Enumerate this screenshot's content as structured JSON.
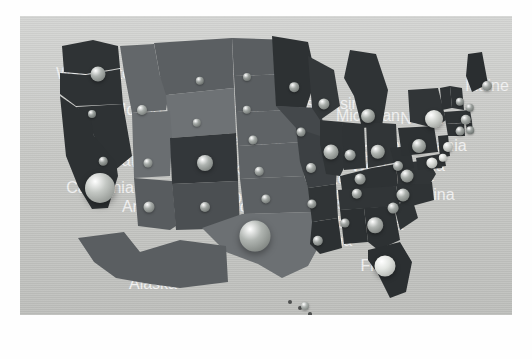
{
  "figure": {
    "type": "map",
    "title": "",
    "canvas_bg": "#c9cac7",
    "state_border_color": "#cfd0cd",
    "label_color": "#f2f2f2"
  },
  "chart_data": {
    "type": "map",
    "title": "",
    "xlabel": "",
    "ylabel": "",
    "projection": "albers-usa",
    "marker_style": "3d-sphere-bubble",
    "legend": "none",
    "grid": false,
    "choropleth_shades": [
      "#2b2f31",
      "#3a3e40",
      "#4e5254",
      "#5d6163",
      "#6a6e70",
      "#7c8082"
    ],
    "bubble_shades": [
      "#6f7473",
      "#8a8f8d",
      "#9ea3a1",
      "#b4b8b5",
      "#d7dad6",
      "#ececea"
    ],
    "states": [
      {
        "name": "Washington",
        "x": 78,
        "y": 58,
        "bubble": 7.5,
        "fill": "#2f3335",
        "shade": "#aeb3b0"
      },
      {
        "name": "Oregon",
        "x": 72,
        "y": 98,
        "bubble": 4.0,
        "fill": "#2e3234",
        "shade": "#9aa09d"
      },
      {
        "name": "Idaho",
        "x": 122,
        "y": 94,
        "bubble": 5.0,
        "fill": "#63676a",
        "shade": "#a8adaa"
      },
      {
        "name": "Montana",
        "x": 180,
        "y": 65,
        "bubble": 4.2,
        "fill": "#5b5f62",
        "shade": "#999e9b"
      },
      {
        "name": "Wyoming",
        "x": 177,
        "y": 107,
        "bubble": 4.2,
        "fill": "#6e7275",
        "shade": "#9fa4a1"
      },
      {
        "name": "North Dakota",
        "x": 227,
        "y": 61,
        "bubble": 4.0,
        "fill": "#5a5e61",
        "shade": "#9a9f9c"
      },
      {
        "name": "South Dakota",
        "x": 227,
        "y": 94,
        "bubble": 4.2,
        "fill": "#5a5e61",
        "shade": "#a0a5a2"
      },
      {
        "name": "Nebraska",
        "x": 233,
        "y": 124,
        "bubble": 4.5,
        "fill": "#5f6366",
        "shade": "#a4a9a6"
      },
      {
        "name": "Nevada",
        "x": 83,
        "y": 145,
        "bubble": 4.3,
        "fill": "#2e3234",
        "shade": "#9ba09d"
      },
      {
        "name": "Utah",
        "x": 128,
        "y": 147,
        "bubble": 4.5,
        "fill": "#6a6e71",
        "shade": "#a5aaa7"
      },
      {
        "name": "Colorado",
        "x": 185,
        "y": 147,
        "bubble": 8.0,
        "fill": "#33373a",
        "shade": "#adb2af"
      },
      {
        "name": "Kansas",
        "x": 239,
        "y": 155,
        "bubble": 4.3,
        "fill": "#5f6366",
        "shade": "#a2a7a4"
      },
      {
        "name": "California",
        "x": 80,
        "y": 172,
        "bubble": 15.0,
        "fill": "#2d3133",
        "shade": "#c3c7c3"
      },
      {
        "name": "Arizona",
        "x": 129,
        "y": 191,
        "bubble": 5.5,
        "fill": "#585c5f",
        "shade": "#a6aba8"
      },
      {
        "name": "New Mexico",
        "x": 185,
        "y": 191,
        "bubble": 5.0,
        "fill": "#4b4f52",
        "shade": "#a0a5a2"
      },
      {
        "name": "Oklahoma",
        "x": 246,
        "y": 183,
        "bubble": 4.6,
        "fill": "#5c6063",
        "shade": "#a1a6a3"
      },
      {
        "name": "Texas",
        "x": 235,
        "y": 220,
        "bubble": 15.5,
        "fill": "#6c7073",
        "shade": "#b0b5b1"
      },
      {
        "name": "Minnesota",
        "x": 274,
        "y": 71,
        "bubble": 4.8,
        "fill": "#2d3133",
        "shade": "#a1a6a3"
      },
      {
        "name": "Iowa",
        "x": 281,
        "y": 116,
        "bubble": 4.5,
        "fill": "#44484b",
        "shade": "#a0a5a2"
      },
      {
        "name": "Missouri",
        "x": 291,
        "y": 152,
        "bubble": 5.0,
        "fill": "#3c4043",
        "shade": "#a3a8a5"
      },
      {
        "name": "Arkansas",
        "x": 292,
        "y": 188,
        "bubble": 4.6,
        "fill": "#303436",
        "shade": "#9ea3a0"
      },
      {
        "name": "Louisiana",
        "x": 298,
        "y": 225,
        "bubble": 5.2,
        "fill": "#2c3032",
        "shade": "#a4a9a6"
      },
      {
        "name": "Wisconsin",
        "x": 304,
        "y": 88,
        "bubble": 5.6,
        "fill": "#34383a",
        "shade": "#a8ada9"
      },
      {
        "name": "Illinois",
        "x": 311,
        "y": 136,
        "bubble": 7.5,
        "fill": "#303436",
        "shade": "#aeb3af"
      },
      {
        "name": "Indiana",
        "x": 330,
        "y": 139,
        "bubble": 5.4,
        "fill": "#2f3335",
        "shade": "#a6aba8"
      },
      {
        "name": "Michigan",
        "x": 348,
        "y": 100,
        "bubble": 7.0,
        "fill": "#2f3335",
        "shade": "#abb0ac"
      },
      {
        "name": "Ohio",
        "x": 358,
        "y": 136,
        "bubble": 7.2,
        "fill": "#313537",
        "shade": "#adb2ae"
      },
      {
        "name": "Kentucky",
        "x": 340,
        "y": 163,
        "bubble": 5.4,
        "fill": "#2e3234",
        "shade": "#a5aaa7"
      },
      {
        "name": "Tennessee",
        "x": 337,
        "y": 178,
        "bubble": 5.2,
        "fill": "#313537",
        "shade": "#a4a9a6"
      },
      {
        "name": "Alabama",
        "x": 325,
        "y": 207,
        "bubble": 4.5,
        "fill": "#2c3032",
        "shade": "#a0a5a2"
      },
      {
        "name": "Georgia",
        "x": 355,
        "y": 209,
        "bubble": 7.8,
        "fill": "#2d3133",
        "shade": "#b0b4b1"
      },
      {
        "name": "Florida",
        "x": 365,
        "y": 250,
        "bubble": 10.5,
        "fill": "#2b2f31",
        "shade": "#e3e6e2"
      },
      {
        "name": "South Carolina",
        "x": 373,
        "y": 192,
        "bubble": 5.4,
        "fill": "#2f3335",
        "shade": "#a6aba8"
      },
      {
        "name": "North Carolina",
        "x": 383,
        "y": 179,
        "bubble": 6.5,
        "fill": "#2f3335",
        "shade": "#a9aeaa"
      },
      {
        "name": "Virginia",
        "x": 387,
        "y": 160,
        "bubble": 6.5,
        "fill": "#313537",
        "shade": "#a9aeaa"
      },
      {
        "name": "West Virginia",
        "x": 378,
        "y": 150,
        "bubble": 5.0,
        "fill": "#2e3234",
        "shade": "#a3a8a5"
      },
      {
        "name": "Pennsylvania",
        "x": 399,
        "y": 130,
        "bubble": 7.0,
        "fill": "#2d3133",
        "shade": "#abb0ac"
      },
      {
        "name": "New York",
        "x": 414,
        "y": 103,
        "bubble": 9.0,
        "fill": "#313537",
        "shade": "#d2d5d1"
      },
      {
        "name": "Maine",
        "x": 467,
        "y": 70,
        "bubble": 5.0,
        "fill": "#2a2e30",
        "shade": "#a2a7a4"
      },
      {
        "name": "Vermont",
        "x": 440,
        "y": 86,
        "bubble": 4.2,
        "fill": "#2e3234",
        "shade": "#9ea3a0"
      },
      {
        "name": "New Hampshire",
        "x": 450,
        "y": 92,
        "bubble": 4.2,
        "fill": "#2e3234",
        "shade": "#9ea3a0"
      },
      {
        "name": "Massachusetts",
        "x": 446,
        "y": 104,
        "bubble": 5.2,
        "fill": "#2e3234",
        "shade": "#a6aba8"
      },
      {
        "name": "Rhode Island",
        "x": 450,
        "y": 114,
        "bubble": 3.8,
        "fill": "#2e3234",
        "shade": "#9aa09d"
      },
      {
        "name": "Connecticut",
        "x": 440,
        "y": 115,
        "bubble": 4.4,
        "fill": "#2e3234",
        "shade": "#a1a6a3"
      },
      {
        "name": "New Jersey",
        "x": 428,
        "y": 131,
        "bubble": 5.0,
        "fill": "#2e3234",
        "shade": "#d0d3cf"
      },
      {
        "name": "Delaware",
        "x": 423,
        "y": 142,
        "bubble": 4.2,
        "fill": "#2e3234",
        "shade": "#dcdfdb"
      },
      {
        "name": "Maryland",
        "x": 412,
        "y": 147,
        "bubble": 5.6,
        "fill": "#2e3234",
        "shade": "#d7dad6"
      },
      {
        "name": "Alaska",
        "x": 133,
        "y": 268,
        "bubble": 0,
        "fill": "#5a5e61",
        "shade": ""
      },
      {
        "name": "Hawaii",
        "x": 285,
        "y": 290,
        "bubble": 4.0,
        "fill": "#4d4f4e",
        "shade": "#aeb3b0"
      }
    ],
    "labels_visible": [
      "Washington",
      "Oregon",
      "Idaho",
      "Montana",
      "Wyoming",
      "North Dakota",
      "South Dakota",
      "Nebraska",
      "Nevada",
      "Utah",
      "Colorado",
      "Kansas",
      "California",
      "Arizona",
      "New Mexico",
      "Oklahoma",
      "Texas",
      "Minnesota",
      "Iowa",
      "Missouri",
      "Arkansas",
      "Louisiana",
      "Wisconsin",
      "Illinois",
      "Indiana",
      "Michigan",
      "Ohio",
      "Kentucky",
      "Tennessee",
      "Alabama",
      "Georgia",
      "Florida",
      "North Carolina",
      "Virginia",
      "West Virginia",
      "Pennsylvania",
      "New York",
      "Maine",
      "Alaska"
    ]
  }
}
